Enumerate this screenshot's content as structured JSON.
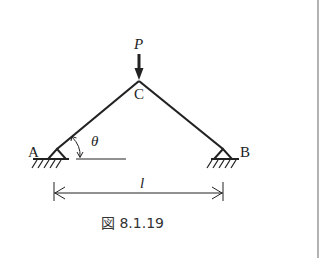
{
  "figure": {
    "caption": "図 8.1.19",
    "labels": {
      "load": "P",
      "apex": "C",
      "left_support": "A",
      "right_support": "B",
      "angle": "θ",
      "span": "l"
    }
  },
  "colors": {
    "stroke": "#222222",
    "border": "#9a9a9a",
    "background": "#ffffff"
  }
}
